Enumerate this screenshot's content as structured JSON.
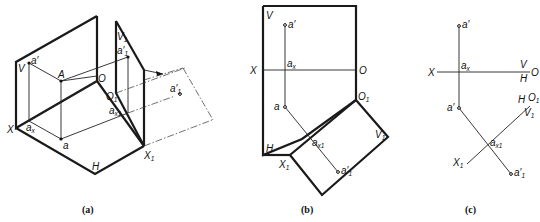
{
  "figure": {
    "panels": [
      {
        "id": "a",
        "caption": "(a)",
        "labels": {
          "V": "V",
          "a_prime": "a′",
          "A": "A",
          "O": "O",
          "X": "X",
          "a_x": "a",
          "a_x_sub": "x",
          "a": "a",
          "H": "H",
          "V1": "V",
          "V1_sub": "1",
          "a1_prime": "a′",
          "a1_prime_sub": "1",
          "O1": "O",
          "O1_sub": "1",
          "a_x1": "a",
          "a_x1_sub": "x1",
          "X1": "X",
          "X1_sub": "1",
          "a1_prime_far": "a′",
          "a1_prime_far_sub": "1"
        }
      },
      {
        "id": "b",
        "caption": "(b)",
        "labels": {
          "V": "V",
          "a_prime": "a′",
          "X": "X",
          "a_x": "a",
          "a_x_sub": "x",
          "O": "O",
          "a": "a",
          "O1": "O",
          "O1_sub": "1",
          "a_x1": "a",
          "a_x1_sub": "x1",
          "V1": "V",
          "V1_sub": "1",
          "H": "H",
          "X1": "X",
          "X1_sub": "1",
          "a1_prime": "a′",
          "a1_prime_sub": "1"
        }
      },
      {
        "id": "c",
        "caption": "(c)",
        "labels": {
          "a_prime": "a′",
          "X": "X",
          "a_x": "a",
          "a_x_sub": "x",
          "V": "V",
          "H": "H",
          "O": "O",
          "a": "a′",
          "H2": "H",
          "O1": "O",
          "O1_sub": "1",
          "V1": "V",
          "V1_sub": "1",
          "a_x1": "a",
          "a_x1_sub": "x1",
          "X1": "X",
          "X1_sub": "1",
          "a1_prime": "a′",
          "a1_prime_sub": "1"
        }
      }
    ]
  }
}
